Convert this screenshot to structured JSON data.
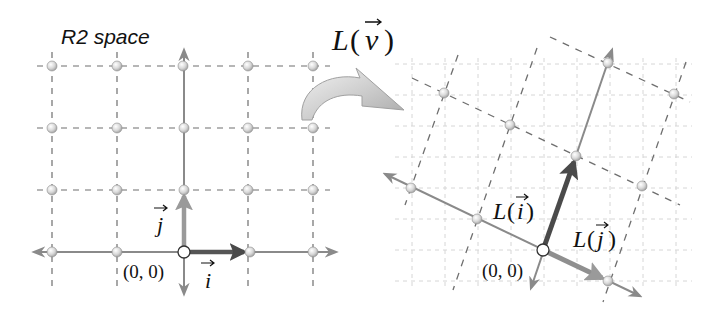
{
  "left_panel": {
    "title": "R2 space",
    "origin_label": "(0, 0)",
    "basis_i_label": "i",
    "basis_j_label": "j",
    "origin_px": [
      184,
      252
    ],
    "grid_step_px": [
      65,
      62
    ],
    "grid_columns": [
      -2,
      -1,
      0,
      1,
      2
    ],
    "grid_rows": [
      0,
      1,
      2,
      3
    ]
  },
  "transform_arrow": {
    "label_fn": "L",
    "label_arg": "v",
    "label_open": "(",
    "label_close": ")"
  },
  "right_panel": {
    "origin_label": "(0, 0)",
    "Li_label_fn": "L",
    "Li_label_arg": "i",
    "Lj_label_fn": "L",
    "Lj_label_arg": "j",
    "paren_open": "(",
    "paren_close": ")",
    "origin_px": [
      543,
      250
    ],
    "L_i_px": [
      33,
      -94
    ],
    "L_j_px": [
      65,
      31
    ],
    "background_grid_step_px": 33
  },
  "colors": {
    "axis": "#8a8a8a",
    "dashed": "#6e6e6e",
    "faint_grid": "#d6d6d6",
    "vector_i": "#555555",
    "vector_j": "#9a9a9a",
    "vector_Li": "#4a4a4a",
    "vector_Lj": "#8f8f8f",
    "text": "#111111"
  }
}
